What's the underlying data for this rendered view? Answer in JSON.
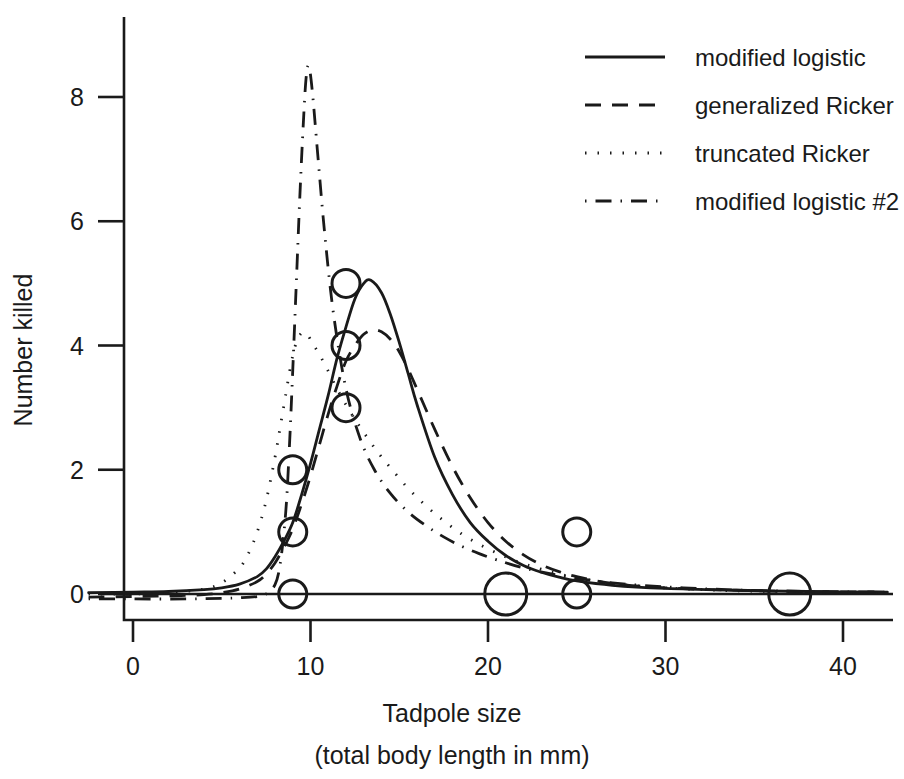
{
  "chart_data": {
    "type": "scatter",
    "title": "",
    "xlabel": "Tadpole size",
    "xlabel_line2": "(total body length in mm)",
    "ylabel": "Number killed",
    "xlim": [
      -2.5,
      42.5
    ],
    "ylim": [
      -0.55,
      9.2
    ],
    "xticks": [
      0,
      10,
      20,
      30,
      40
    ],
    "xtick_labels": [
      "0",
      "10",
      "20",
      "30",
      "40"
    ],
    "yticks": [
      0,
      2,
      4,
      6,
      8
    ],
    "ytick_labels": [
      "0",
      "2",
      "4",
      "6",
      "8"
    ],
    "grid": false,
    "legend_position": "top-right",
    "marker": "open-circle",
    "points": [
      {
        "x": 9,
        "y": 2,
        "size": 1
      },
      {
        "x": 9,
        "y": 1,
        "size": 1
      },
      {
        "x": 9,
        "y": 0,
        "size": 1
      },
      {
        "x": 12,
        "y": 5,
        "size": 1
      },
      {
        "x": 12,
        "y": 4,
        "size": 1
      },
      {
        "x": 12,
        "y": 3,
        "size": 1
      },
      {
        "x": 21,
        "y": 0,
        "size": 2
      },
      {
        "x": 25,
        "y": 1,
        "size": 1
      },
      {
        "x": 25,
        "y": 0,
        "size": 1
      },
      {
        "x": 37,
        "y": 0,
        "size": 2
      }
    ],
    "series": [
      {
        "name": "modified logistic",
        "style": "solid",
        "x": [
          -2.5,
          0,
          2,
          4,
          5,
          6,
          7,
          7.5,
          8,
          8.5,
          9,
          9.5,
          10,
          10.5,
          11,
          11.5,
          12,
          12.5,
          13,
          13.4,
          14,
          14.5,
          15,
          15.5,
          16,
          17,
          18,
          19,
          20,
          21,
          22,
          23,
          24,
          25,
          27,
          30,
          34,
          38,
          42.5
        ],
        "y": [
          0.02,
          0.03,
          0.04,
          0.07,
          0.1,
          0.16,
          0.28,
          0.4,
          0.6,
          0.85,
          1.15,
          1.6,
          2.1,
          2.65,
          3.2,
          3.8,
          4.3,
          4.75,
          5.0,
          5.05,
          4.85,
          4.5,
          4.05,
          3.55,
          3.05,
          2.2,
          1.6,
          1.15,
          0.85,
          0.62,
          0.46,
          0.35,
          0.27,
          0.21,
          0.14,
          0.09,
          0.06,
          0.04,
          0.03
        ]
      },
      {
        "name": "generalized Ricker",
        "style": "dashed",
        "x": [
          -2.5,
          0,
          2,
          4,
          5,
          6,
          7,
          7.5,
          8,
          8.5,
          9,
          9.5,
          10,
          10.5,
          11,
          11.5,
          12,
          12.5,
          13,
          13.5,
          14,
          14.5,
          15,
          15.5,
          16,
          17,
          18,
          19,
          20,
          21,
          22,
          23,
          24,
          25,
          27,
          30,
          34,
          38,
          42.5
        ],
        "y": [
          -0.05,
          -0.04,
          -0.03,
          -0.01,
          0.02,
          0.08,
          0.2,
          0.32,
          0.5,
          0.75,
          1.05,
          1.45,
          1.9,
          2.4,
          2.9,
          3.35,
          3.75,
          4.0,
          4.18,
          4.25,
          4.22,
          4.1,
          3.9,
          3.62,
          3.3,
          2.65,
          2.05,
          1.55,
          1.15,
          0.85,
          0.63,
          0.47,
          0.36,
          0.28,
          0.17,
          0.1,
          0.06,
          0.04,
          0.03
        ]
      },
      {
        "name": "truncated Ricker",
        "style": "dotted",
        "x": [
          -2.5,
          0,
          2,
          4,
          5,
          6,
          6.5,
          7,
          7.5,
          8,
          8.3,
          8.6,
          8.9,
          9.2,
          9.5,
          9.8,
          10.2,
          10.8,
          11.5,
          12.2,
          13,
          13.8,
          14.6,
          15.5,
          16.5,
          17.5,
          18.5,
          19.5,
          20.5,
          21.5,
          23,
          25,
          28,
          32,
          36,
          42.5
        ],
        "y": [
          0.0,
          0.0,
          0.02,
          0.08,
          0.18,
          0.42,
          0.65,
          1.0,
          1.5,
          2.2,
          2.7,
          3.2,
          3.7,
          4.05,
          4.2,
          4.18,
          4.0,
          3.7,
          3.3,
          2.95,
          2.6,
          2.28,
          2.0,
          1.7,
          1.42,
          1.18,
          0.97,
          0.8,
          0.66,
          0.54,
          0.4,
          0.26,
          0.14,
          0.07,
          0.04,
          0.02
        ]
      },
      {
        "name": "modified logistic #2",
        "style": "dashdot",
        "x": [
          -2.5,
          0,
          3,
          5,
          6,
          7,
          7.5,
          8,
          8.3,
          8.6,
          8.8,
          9.0,
          9.2,
          9.4,
          9.6,
          9.75,
          9.9,
          10.1,
          10.4,
          10.8,
          11.3,
          12,
          12.8,
          13.6,
          14.5,
          15.5,
          16.5,
          17.5,
          18.5,
          19.5,
          20.5,
          22,
          24,
          27,
          31,
          36,
          42.5
        ],
        "y": [
          -0.08,
          -0.08,
          -0.08,
          -0.07,
          -0.06,
          -0.04,
          0.0,
          0.15,
          0.5,
          1.3,
          2.3,
          3.6,
          5.0,
          6.4,
          7.6,
          8.3,
          8.5,
          8.1,
          7.1,
          5.8,
          4.5,
          3.3,
          2.5,
          2.0,
          1.62,
          1.32,
          1.1,
          0.92,
          0.77,
          0.65,
          0.55,
          0.42,
          0.3,
          0.18,
          0.1,
          0.05,
          0.03
        ]
      }
    ]
  },
  "legend": {
    "entries": [
      {
        "label": "modified logistic",
        "style": "solid"
      },
      {
        "label": "generalized Ricker",
        "style": "dashed"
      },
      {
        "label": "truncated Ricker",
        "style": "dotted"
      },
      {
        "label": "modified logistic #2",
        "style": "dashdot"
      }
    ]
  },
  "colors": {
    "ink": "#1a1a1a",
    "background": "#ffffff"
  }
}
